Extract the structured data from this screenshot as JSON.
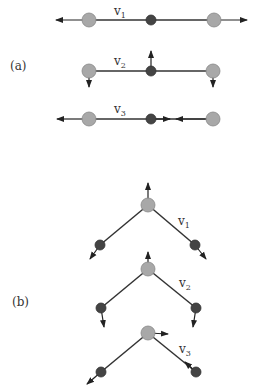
{
  "panels": [
    {
      "label": "(a)",
      "title": "Linear molecule normal modes",
      "modes": [
        {
          "name": "v",
          "sub": "1",
          "description": "symmetric stretch: outer atoms move outward, center fixed"
        },
        {
          "name": "v",
          "sub": "2",
          "description": "bend: center atom up, outer atoms down"
        },
        {
          "name": "v",
          "sub": "3",
          "description": "asymmetric stretch: left outer left, center right, right outer left"
        }
      ]
    },
    {
      "label": "(b)",
      "title": "Bent molecule normal modes",
      "modes": [
        {
          "name": "v",
          "sub": "1",
          "description": "symmetric stretch"
        },
        {
          "name": "v",
          "sub": "2",
          "description": "bend"
        },
        {
          "name": "v",
          "sub": "3",
          "description": "asymmetric stretch"
        }
      ]
    }
  ],
  "colors": {
    "outer_atom": "#a8a8a8",
    "center_atom": "#444444",
    "bond": "#333333",
    "arrow": "#222222"
  }
}
